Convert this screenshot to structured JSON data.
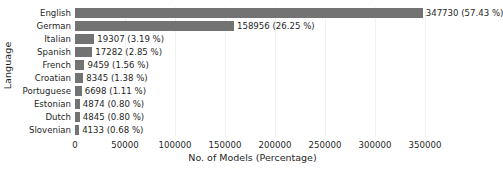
{
  "chart_data": {
    "type": "bar",
    "orientation": "horizontal",
    "title": "",
    "xlabel": "No. of Models (Percentage)",
    "ylabel": "Language",
    "categories": [
      "English",
      "German",
      "Italian",
      "Spanish",
      "French",
      "Croatian",
      "Portuguese",
      "Estonian",
      "Dutch",
      "Slovenian"
    ],
    "values": [
      347730,
      158956,
      19307,
      17282,
      9459,
      8345,
      6698,
      4874,
      4845,
      4133
    ],
    "percentages": [
      57.43,
      26.25,
      3.19,
      2.85,
      1.56,
      1.38,
      1.11,
      0.8,
      0.8,
      0.68
    ],
    "bar_labels": [
      "347730 (57.43 %)",
      "158956 (26.25 %)",
      "19307 (3.19 %)",
      "17282 (2.85 %)",
      "9459 (1.56 %)",
      "8345 (1.38 %)",
      "6698 (1.11 %)",
      "4874 (0.80 %)",
      "4845 (0.80 %)",
      "4133 (0.68 %)"
    ],
    "xticks": [
      0,
      50000,
      100000,
      150000,
      200000,
      250000,
      300000,
      350000
    ],
    "xtick_labels": [
      "0",
      "50000",
      "100000",
      "150000",
      "200000",
      "250000",
      "300000",
      "350000"
    ],
    "xlim": [
      0,
      355000
    ],
    "grid": "vertical-light",
    "legend": "none",
    "bar_color": "#737373",
    "background_color": "#ffffff",
    "text_color": "#1f1f1f",
    "gridline_color": "#f0f0f0"
  }
}
